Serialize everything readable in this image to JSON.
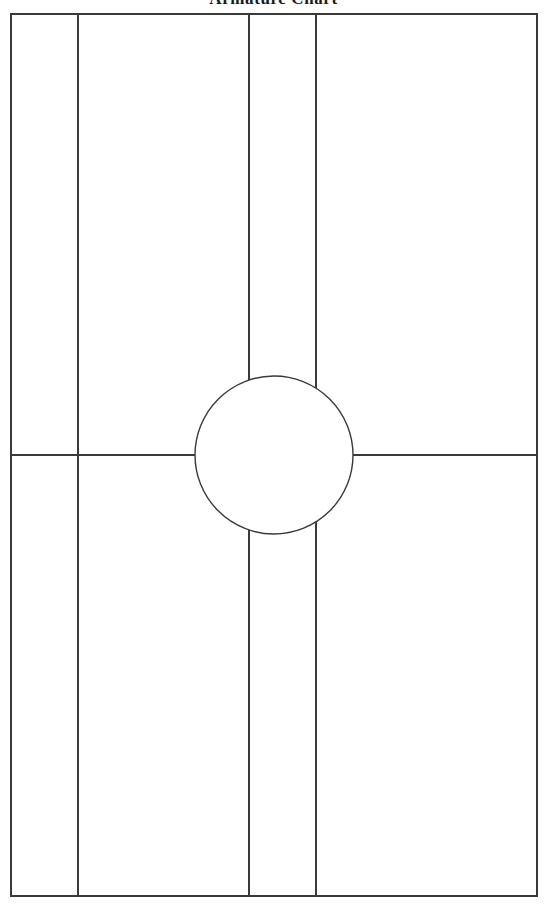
{
  "title": "Armature Chart",
  "canvas": {
    "width": 547,
    "height": 904,
    "background": "#ffffff"
  },
  "style": {
    "stroke_color": "#3a3a3a",
    "border_color": "#3a3a3a",
    "fill_color": "#ffffff",
    "stroke_width": 1.4,
    "border_width": 1.6
  },
  "chart_data": {
    "type": "diagram",
    "title": "Armature Chart",
    "xlabel": "",
    "ylabel": "",
    "grid": false,
    "legend": null,
    "xlim": [
      0,
      547
    ],
    "ylim": [
      0,
      904
    ],
    "frame": {
      "name": "outer-rectangle",
      "x0": 11,
      "y0": 14,
      "x1": 537,
      "y1": 896,
      "width": 526,
      "height": 882,
      "fill": "#ffffff",
      "stroke": "#3a3a3a"
    },
    "vertical_lines": [
      {
        "name": "vertical-rule-1",
        "x": 78,
        "y0": 14,
        "y1": 896,
        "masked_by_circle": false
      },
      {
        "name": "vertical-rule-2",
        "x": 249,
        "y0": 14,
        "y1": 896,
        "masked_by_circle": true
      },
      {
        "name": "vertical-rule-3",
        "x": 316,
        "y0": 14,
        "y1": 896,
        "masked_by_circle": true
      }
    ],
    "horizontal_lines": [
      {
        "name": "horizontal-rule-1",
        "y": 455,
        "x0": 11,
        "x1": 537,
        "masked_by_circle": true
      }
    ],
    "circle": {
      "name": "center-circle",
      "cx": 274,
      "cy": 455,
      "r": 79,
      "diameter": 158,
      "fill": "#ffffff",
      "stroke": "#3a3a3a",
      "occludes_lines": true
    },
    "panels": [
      {
        "name": "panel-1",
        "x0": 11,
        "x1": 78,
        "width": 67
      },
      {
        "name": "panel-2",
        "x0": 78,
        "x1": 249,
        "width": 171
      },
      {
        "name": "panel-3",
        "x0": 249,
        "x1": 316,
        "width": 67
      },
      {
        "name": "panel-4",
        "x0": 316,
        "x1": 537,
        "width": 221
      }
    ]
  }
}
